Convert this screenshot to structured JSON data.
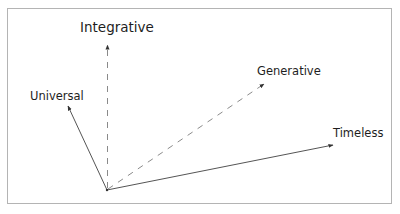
{
  "diagram": {
    "type": "vector-diagram",
    "origin": {
      "x": 107,
      "y": 190
    },
    "labels": {
      "integrative": "Integrative",
      "universal": "Universal",
      "generative": "Generative",
      "timeless": "Timeless"
    },
    "vectors": [
      {
        "name": "Universal",
        "style": "solid",
        "tip": {
          "x": 68,
          "y": 106
        }
      },
      {
        "name": "Integrative",
        "style": "dashed",
        "tip": {
          "x": 108,
          "y": 45
        }
      },
      {
        "name": "Generative",
        "style": "dashed",
        "tip": {
          "x": 264,
          "y": 84
        }
      },
      {
        "name": "Timeless",
        "style": "solid",
        "tip": {
          "x": 333,
          "y": 145
        }
      }
    ],
    "colors": {
      "solid_line": "#555555",
      "dashed_line": "#8a8a8a",
      "frame_border": "#b4b4b4",
      "text": "#1e1e1e"
    }
  }
}
